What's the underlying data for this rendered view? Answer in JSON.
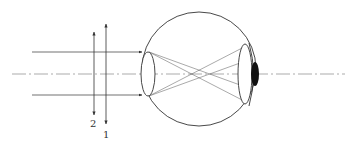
{
  "diagram": {
    "title": "",
    "labels": {
      "lens_1": "1",
      "lens_2": "2"
    },
    "colors": {
      "stroke": "#333333",
      "axis": "#888888",
      "fill_dark": "#111111",
      "background": "#ffffff"
    },
    "elements": [
      "optical-axis",
      "incoming-parallel-rays",
      "lens-1-double-arrow",
      "lens-2-double-arrow",
      "eyeball",
      "eye-lens",
      "retina",
      "crossed-rays"
    ]
  }
}
